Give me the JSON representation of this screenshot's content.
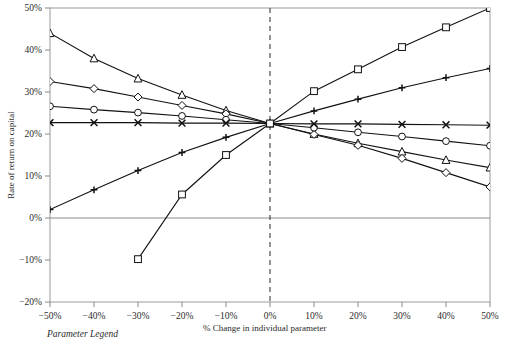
{
  "chart_data": {
    "type": "line",
    "title": "",
    "subtitle": "",
    "xlabel": "% Change in individual parameter",
    "ylabel": "Rate of return on capital",
    "xlim": [
      -50,
      50
    ],
    "ylim": [
      -20,
      50
    ],
    "x": [
      -50,
      -40,
      -30,
      -20,
      -10,
      0,
      10,
      20,
      30,
      40,
      50
    ],
    "xtick_labels": [
      "−50%",
      "−40%",
      "−30%",
      "−20%",
      "−10%",
      "0%",
      "10%",
      "20%",
      "30%",
      "40%",
      "50%"
    ],
    "ytick_values": [
      50,
      40,
      30,
      20,
      10,
      0,
      -10,
      -20
    ],
    "ytick_labels": [
      "50%",
      "40%",
      "30%",
      "20%",
      "10%",
      "0%",
      "−10%",
      "−20%"
    ],
    "grid": false,
    "legend_position": "below-plot",
    "legend_caption": "Parameter Legend",
    "convergence_point": {
      "x": 0,
      "y": 22.5
    },
    "zero_reference_line": 0,
    "vertical_reference_line": 0,
    "series": [
      {
        "name": "series-triangle",
        "marker": "triangle",
        "x": [
          -50,
          -40,
          -30,
          -20,
          -10,
          0,
          10,
          20,
          30,
          40,
          50
        ],
        "values": [
          44.0,
          38.0,
          33.2,
          29.3,
          25.6,
          22.5,
          20.0,
          17.8,
          15.8,
          13.8,
          12.0
        ]
      },
      {
        "name": "series-diamond",
        "marker": "diamond",
        "x": [
          -50,
          -40,
          -30,
          -20,
          -10,
          0,
          10,
          20,
          30,
          40,
          50
        ],
        "values": [
          32.5,
          30.8,
          28.8,
          26.8,
          24.8,
          22.5,
          19.9,
          17.3,
          14.2,
          10.8,
          7.4
        ]
      },
      {
        "name": "series-circle",
        "marker": "circle",
        "x": [
          -50,
          -40,
          -30,
          -20,
          -10,
          0,
          10,
          20,
          30,
          40,
          50
        ],
        "values": [
          26.6,
          25.8,
          25.1,
          24.3,
          23.4,
          22.5,
          21.5,
          20.4,
          19.4,
          18.3,
          17.2
        ]
      },
      {
        "name": "series-cross",
        "marker": "x",
        "x": [
          -50,
          -40,
          -30,
          -20,
          -10,
          0,
          10,
          20,
          30,
          40,
          50
        ],
        "values": [
          22.7,
          22.7,
          22.7,
          22.6,
          22.6,
          22.5,
          22.4,
          22.4,
          22.3,
          22.2,
          22.1
        ]
      },
      {
        "name": "series-plus",
        "marker": "plus",
        "x": [
          -50,
          -40,
          -30,
          -20,
          -10,
          0,
          10,
          20,
          30,
          40,
          50
        ],
        "values": [
          2.0,
          6.7,
          11.3,
          15.6,
          19.2,
          22.5,
          25.5,
          28.3,
          31.0,
          33.4,
          35.6
        ]
      },
      {
        "name": "series-square",
        "marker": "square",
        "x": [
          -30,
          -20,
          -10,
          0,
          10,
          20,
          30,
          40,
          50
        ],
        "values": [
          -9.8,
          5.6,
          15.0,
          22.5,
          30.2,
          35.4,
          40.7,
          45.4,
          50.0
        ]
      }
    ]
  }
}
